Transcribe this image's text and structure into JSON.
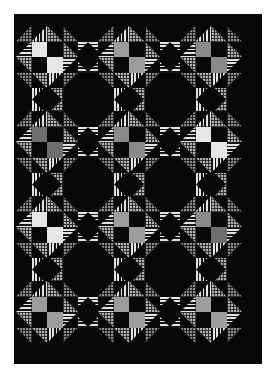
{
  "image": {
    "kind": "quilt-photograph",
    "title": "Pieced star quilt",
    "background_color": "#ffffff",
    "quilt_background_color": "#070707",
    "quilt_rect": {
      "x": 14,
      "y": 14,
      "width": 248,
      "height": 350
    }
  },
  "palette": {
    "black": "#070707",
    "light_gray": "#d9d9d9",
    "lighter_gray": "#e6e6e6",
    "mid_gray": "#9c9c9c",
    "mid_gray_2": "#8a8a8a",
    "dark_gray": "#6e6e6e",
    "grid_fabric": "#b4b4b4",
    "grid_fabric_dark": "#8f8f8f",
    "stripe_light": "#e4e4e4",
    "stripe_dark": "#141414"
  },
  "layout": {
    "star_columns": 3,
    "star_rows": 4,
    "star_size": 62,
    "star_centers_x": [
      47,
      129,
      211
    ],
    "star_centers_y": [
      57,
      142,
      227,
      312
    ],
    "column_pitch": 82,
    "row_pitch": 85,
    "diamond_size": 30
  },
  "fabrics": [
    {
      "name": "black-solid",
      "label": "Black solid",
      "swatch": "#070707"
    },
    {
      "name": "grid-check",
      "label": "Gray grid check",
      "swatch": "#b4b4b4"
    },
    {
      "name": "grid-check-dark",
      "label": "Dark gray grid check",
      "swatch": "#8f8f8f"
    },
    {
      "name": "horizontal-stripe",
      "label": "Black/white horizontal stripe",
      "swatch": "#e4e4e4"
    },
    {
      "name": "vertical-stripe",
      "label": "Black/white vertical stripe",
      "swatch": "#e4e4e4"
    },
    {
      "name": "light-gray-solid",
      "label": "Light gray solid",
      "swatch": "#d9d9d9"
    },
    {
      "name": "mid-gray-solid",
      "label": "Medium gray solid",
      "swatch": "#9c9c9c"
    },
    {
      "name": "dark-gray-solid",
      "label": "Dark gray solid",
      "swatch": "#6e6e6e"
    }
  ],
  "blocks": {
    "stars": [
      {
        "row": 0,
        "col": 0,
        "center_tl": "#e6e6e6",
        "center_br": "#e6e6e6"
      },
      {
        "row": 0,
        "col": 1,
        "center_tl": "#9c9c9c",
        "center_br": "#9c9c9c"
      },
      {
        "row": 0,
        "col": 2,
        "center_tl": "#8a8a8a",
        "center_br": "#8a8a8a"
      },
      {
        "row": 1,
        "col": 0,
        "center_tl": "#6e6e6e",
        "center_br": "#6e6e6e"
      },
      {
        "row": 1,
        "col": 1,
        "center_tl": "#8a8a8a",
        "center_br": "#8a8a8a"
      },
      {
        "row": 1,
        "col": 2,
        "center_tl": "#e6e6e6",
        "center_br": "#e6e6e6"
      },
      {
        "row": 2,
        "col": 0,
        "center_tl": "#e6e6e6",
        "center_br": "#e6e6e6"
      },
      {
        "row": 2,
        "col": 1,
        "center_tl": "#9c9c9c",
        "center_br": "#9c9c9c"
      },
      {
        "row": 2,
        "col": 2,
        "center_tl": "#8a8a8a",
        "center_br": "#6e6e6e"
      },
      {
        "row": 3,
        "col": 0,
        "center_tl": "#9c9c9c",
        "center_br": "#9c9c9c"
      },
      {
        "row": 3,
        "col": 1,
        "center_tl": "#9c9c9c",
        "center_br": "#9c9c9c"
      },
      {
        "row": 3,
        "col": 2,
        "center_tl": "#9c9c9c",
        "center_br": "#9c9c9c"
      }
    ],
    "horizontal_sashing_diamonds": [
      {
        "row": 0,
        "gap": 0
      },
      {
        "row": 0,
        "gap": 1
      },
      {
        "row": 1,
        "gap": 0
      },
      {
        "row": 1,
        "gap": 1
      },
      {
        "row": 2,
        "gap": 0
      },
      {
        "row": 2,
        "gap": 1
      },
      {
        "row": 3,
        "gap": 0
      },
      {
        "row": 3,
        "gap": 1
      }
    ],
    "vertical_sashing_diamonds": [
      {
        "col": 0,
        "gap": 0
      },
      {
        "col": 1,
        "gap": 0
      },
      {
        "col": 2,
        "gap": 0
      },
      {
        "col": 0,
        "gap": 1
      },
      {
        "col": 1,
        "gap": 1
      },
      {
        "col": 2,
        "gap": 1
      },
      {
        "col": 0,
        "gap": 2
      },
      {
        "col": 1,
        "gap": 2
      },
      {
        "col": 2,
        "gap": 2
      }
    ]
  }
}
